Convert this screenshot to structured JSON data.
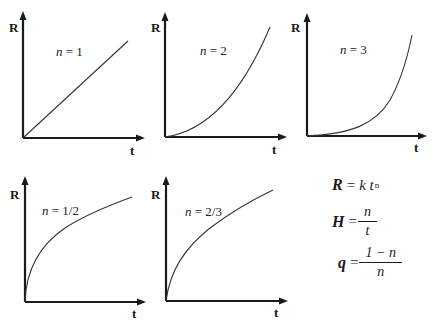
{
  "figure": {
    "axis_labels": {
      "y": "R",
      "x": "t"
    },
    "panels": [
      {
        "id": "n1",
        "label_var": "n",
        "label_rest": " = 1",
        "exponent": 1
      },
      {
        "id": "n2",
        "label_var": "n",
        "label_rest": " = 2",
        "exponent": 2
      },
      {
        "id": "n3",
        "label_var": "n",
        "label_rest": " = 3",
        "exponent": 3
      },
      {
        "id": "n1_2",
        "label_var": "n",
        "label_rest": " = 1/2",
        "exponent": 0.5
      },
      {
        "id": "n2_3",
        "label_var": "n",
        "label_rest": " = 2/3",
        "exponent": 0.6667
      }
    ],
    "formulas": {
      "f1": {
        "lhs": "R",
        "eq": "=",
        "k": "k",
        "t": "t",
        "sup": "n"
      },
      "f2": {
        "lhs": "H",
        "eq": "=",
        "num": "n",
        "den": "t"
      },
      "f3": {
        "lhs": "q",
        "eq": "=",
        "num": "1 − n",
        "den": "n"
      }
    }
  }
}
